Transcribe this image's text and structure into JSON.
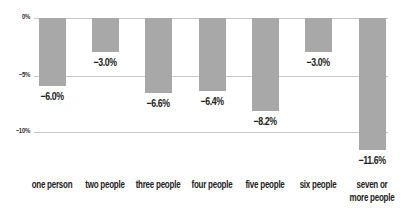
{
  "chart_data": {
    "type": "bar",
    "title": "",
    "xlabel": "",
    "ylabel": "",
    "categories": [
      "one person",
      "two people",
      "three people",
      "four people",
      "five people",
      "six people",
      "seven or more people"
    ],
    "values": [
      -6.0,
      -3.0,
      -6.6,
      -6.4,
      -8.2,
      -3.0,
      -11.6
    ],
    "value_labels": [
      "−6.0%",
      "−3.0%",
      "−6.6%",
      "−6.4%",
      "−8.2%",
      "−3.0%",
      "−11.6%"
    ],
    "yticks": [
      "0%",
      "−5%",
      "−10%"
    ],
    "ytick_values": [
      0,
      -5,
      -10
    ],
    "ylim": [
      -12,
      0
    ],
    "grid": true,
    "legend": null,
    "bar_color": "#a8a8a8"
  },
  "xlabels": {
    "c0": "one person",
    "c1": "two people",
    "c2": "three people",
    "c3": "four people",
    "c4": "five people",
    "c5": "six people",
    "c6a": "seven or",
    "c6b": "more people"
  }
}
